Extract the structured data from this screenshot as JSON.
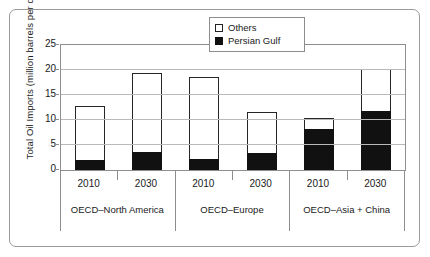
{
  "chart_data": {
    "type": "bar",
    "stacked": true,
    "title": "",
    "xlabel": "",
    "ylabel": "Total Oil Imports (million barrels per day)",
    "ylim": [
      0,
      25
    ],
    "yticks": [
      0,
      5,
      10,
      15,
      20,
      25
    ],
    "grid": true,
    "legend_position": "top-center-inside",
    "groups": [
      {
        "label": "OECD–North America",
        "categories": [
          "2010",
          "2030"
        ]
      },
      {
        "label": "OECD–Europe",
        "categories": [
          "2010",
          "2030"
        ]
      },
      {
        "label": "OECD–Asia + China",
        "categories": [
          "2010",
          "2030"
        ]
      }
    ],
    "categories": [
      "2010",
      "2030",
      "2010",
      "2030",
      "2010",
      "2030"
    ],
    "series": [
      {
        "name": "Persian Gulf",
        "color": "#111111",
        "values": [
          2.0,
          3.6,
          2.2,
          3.4,
          8.2,
          11.8
        ]
      },
      {
        "name": "Others",
        "color": "#ffffff",
        "values": [
          10.8,
          15.9,
          16.4,
          8.2,
          2.3,
          8.4
        ]
      }
    ],
    "totals": [
      12.8,
      19.5,
      18.6,
      11.6,
      10.5,
      20.2
    ]
  },
  "legend": {
    "items": [
      {
        "label": "Others",
        "swatch": "open-square"
      },
      {
        "label": "Persian Gulf",
        "swatch": "filled-square"
      }
    ]
  },
  "axes": {
    "y": {
      "title": "Total Oil Imports (million barrels per day)",
      "ticks": [
        "0",
        "5",
        "10",
        "15",
        "20",
        "25"
      ]
    },
    "x": {
      "tier1": [
        "2010",
        "2030",
        "2010",
        "2030",
        "2010",
        "2030"
      ],
      "tier2": [
        "OECD–North America",
        "OECD–Europe",
        "OECD–Asia + China"
      ]
    }
  }
}
